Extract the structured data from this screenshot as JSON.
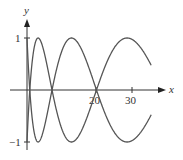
{
  "chart_data": {
    "type": "line",
    "title": "",
    "xlabel": "x",
    "ylabel": "y",
    "x_ticks": [
      20,
      30
    ],
    "y_ticks": [
      1,
      -1
    ],
    "xlim": [
      0,
      39
    ],
    "ylim": [
      -1.2,
      1.4
    ],
    "grid": false,
    "legend": null,
    "series": [
      {
        "name": "upper curve",
        "formula": "y = cos(1.75*sqrt(x))",
        "x": [
          0,
          0.8,
          1.5,
          4.5,
          7.3,
          10,
          15,
          20.3,
          25,
          31,
          36
        ],
        "values": [
          1,
          0.0,
          -0.51,
          -1.0,
          0.0,
          0.69,
          1.0,
          0.0,
          -0.79,
          -1.0,
          -0.55
        ]
      },
      {
        "name": "lower curve",
        "formula": "y = -cos(1.75*sqrt(x))",
        "x": [
          0,
          0.8,
          1.5,
          4.5,
          7.3,
          10,
          15,
          20.3,
          25,
          31,
          36
        ],
        "values": [
          -1,
          0.0,
          0.51,
          1.0,
          0.0,
          -0.69,
          -1.0,
          0.0,
          0.79,
          1.0,
          0.55
        ]
      }
    ]
  },
  "labels": {
    "x_axis": "x",
    "y_axis": "y",
    "tick_20": "20",
    "tick_30": "30",
    "tick_y_pos": "1",
    "tick_y_neg": "−1"
  },
  "style": {
    "curve_color": "#555555",
    "axis_color": "#333333"
  }
}
